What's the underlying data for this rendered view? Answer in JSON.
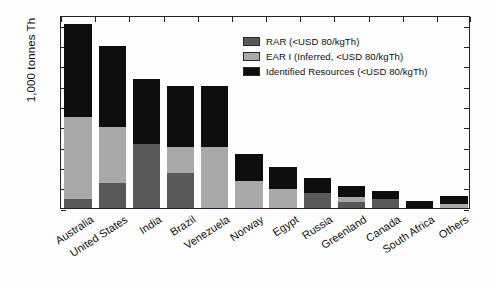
{
  "chart_data": {
    "type": "bar",
    "stacked": true,
    "title": "",
    "xlabel": "",
    "ylabel": "1,000 tonnes Th",
    "ylim": [
      0,
      950
    ],
    "yticks": [
      0,
      100,
      200,
      300,
      400,
      500,
      600,
      700,
      800,
      900
    ],
    "ytick_labels": [
      "0",
      "100",
      "200",
      "300",
      "400",
      "500",
      "600",
      "700",
      "800",
      "900"
    ],
    "grid": false,
    "legend_position": "upper right",
    "categories": [
      "Australia",
      "United States",
      "India",
      "Brazil",
      "Venezuela",
      "Norway",
      "Egypt",
      "Russia",
      "Greenland",
      "Canada",
      "South Africa",
      "Others"
    ],
    "series": [
      {
        "name": "RAR (<USD 80/kgTh)",
        "color": "#585858",
        "values": [
          45,
          122,
          315,
          172,
          0,
          0,
          0,
          75,
          32,
          45,
          0,
          0
        ]
      },
      {
        "name": "EAR I (Inferred, <USD 80/kgTh)",
        "color": "#a9a9a9",
        "values": [
          405,
          275,
          0,
          128,
          300,
          132,
          95,
          0,
          22,
          0,
          0,
          22
        ]
      },
      {
        "name": "Identified Resources (<USD 80/kgTh)",
        "color": "#0d0d0d",
        "values": [
          455,
          403,
          322,
          303,
          300,
          133,
          105,
          75,
          52,
          41,
          35,
          38
        ]
      }
    ],
    "cumulative_totals": {
      "rar": [
        45,
        122,
        315,
        172,
        0,
        0,
        0,
        75,
        32,
        45,
        0,
        0
      ],
      "ear_i_top": [
        450,
        397,
        315,
        300,
        300,
        132,
        95,
        75,
        54,
        45,
        0,
        22
      ],
      "total": [
        905,
        800,
        637,
        603,
        600,
        265,
        200,
        150,
        106,
        86,
        35,
        60
      ]
    }
  },
  "legend": {
    "items": [
      {
        "label": "RAR (<USD 80/kgTh)",
        "color": "#585858"
      },
      {
        "label": "EAR I (Inferred, <USD 80/kgTh)",
        "color": "#a9a9a9"
      },
      {
        "label": "Identified Resources (<USD 80/kgTh)",
        "color": "#0d0d0d"
      }
    ]
  }
}
